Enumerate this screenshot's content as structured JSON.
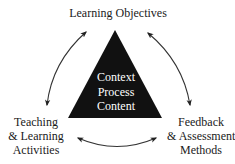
{
  "diagram": {
    "type": "cycle-triangle",
    "colors": {
      "triangle": "#111111",
      "text": "#1a1a1a",
      "center_text": "#ffffff",
      "arrow": "#333333",
      "background": "#ffffff"
    },
    "nodes": {
      "top": {
        "lines": [
          "Learning Objectives"
        ]
      },
      "left": {
        "lines": [
          "Teaching",
          "& Learning",
          "Activities"
        ]
      },
      "right": {
        "lines": [
          "Feedback",
          "& Assessment",
          "Methods"
        ]
      }
    },
    "center": {
      "lines": [
        "Context",
        "Process",
        "Content"
      ]
    },
    "edges": [
      {
        "from": "top",
        "to": "left",
        "bidirectional": true
      },
      {
        "from": "top",
        "to": "right",
        "bidirectional": true
      },
      {
        "from": "left",
        "to": "right",
        "bidirectional": true
      }
    ]
  }
}
